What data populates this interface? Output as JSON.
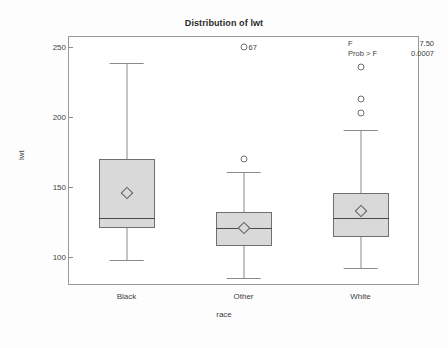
{
  "chart_data": {
    "type": "box",
    "title": "Distribution of lwt",
    "xlabel": "race",
    "ylabel": "lwt",
    "ylim": [
      80,
      258
    ],
    "yticks": [
      100,
      150,
      200,
      250
    ],
    "ytick_labels": [
      "100",
      "150",
      "200",
      "250"
    ],
    "categories": [
      "Black",
      "Other",
      "White"
    ],
    "grid": false,
    "legend": "none",
    "boxes": [
      {
        "category": "Black",
        "min": 98,
        "q1": 121,
        "median": 128,
        "q3": 170,
        "max": 239,
        "mean": 146,
        "outliers": [],
        "outlier_labels": []
      },
      {
        "category": "Other",
        "min": 85,
        "q1": 108,
        "median": 121,
        "q3": 132,
        "max": 161,
        "mean": 121,
        "outliers": [
          170,
          250
        ],
        "outlier_labels": [
          "",
          "67"
        ]
      },
      {
        "category": "White",
        "min": 92,
        "q1": 114,
        "median": 128,
        "q3": 146,
        "max": 191,
        "mean": 133,
        "outliers": [
          203,
          213,
          236
        ],
        "outlier_labels": [
          "",
          "",
          ""
        ]
      }
    ],
    "annotations": {
      "f_label": "F",
      "f_value": "7.50",
      "prob_label": "Prob > F",
      "prob_value": "0.0007"
    }
  },
  "colors": {
    "box_fill": "#d9d9d9",
    "box_stroke": "#707070",
    "whisker": "#8a8a8a",
    "frame": "#9a9a9a",
    "text": "#3f3f3f"
  }
}
